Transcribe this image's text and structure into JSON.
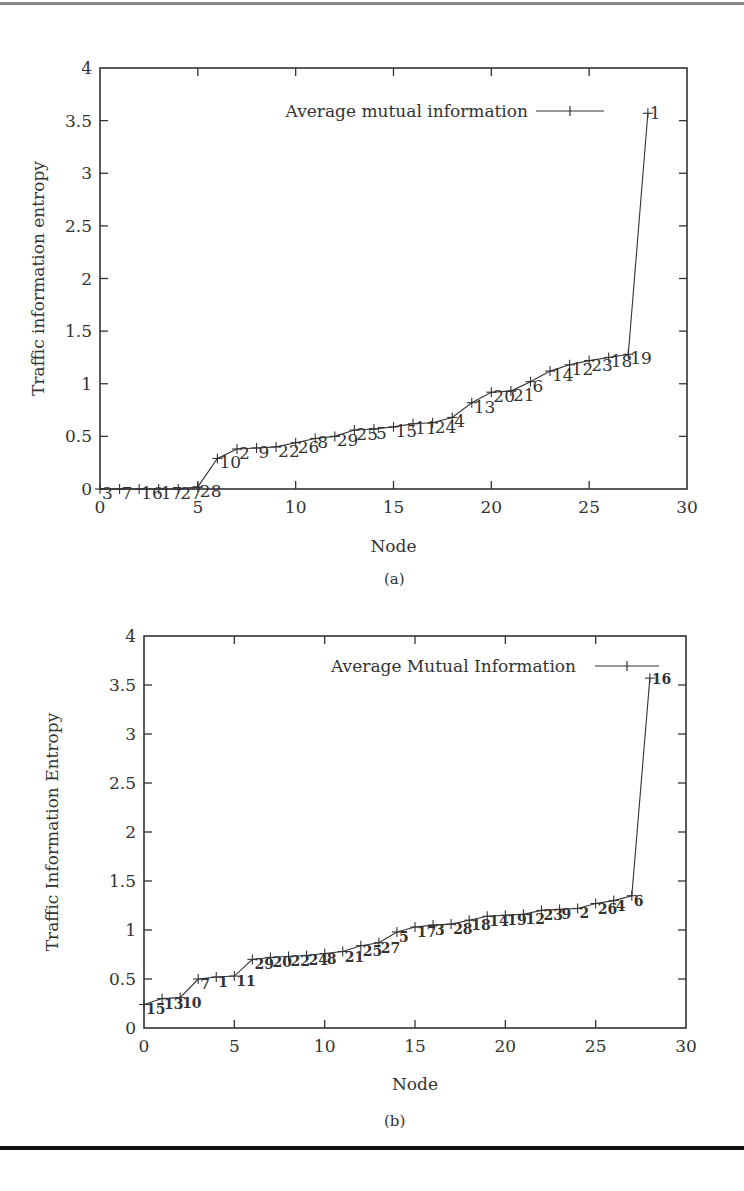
{
  "chart_data": [
    {
      "type": "line",
      "panel": "(a)",
      "title": "",
      "xlabel": "Node",
      "ylabel": "Traffic information entropy",
      "xlim": [
        0,
        30
      ],
      "ylim": [
        0,
        4
      ],
      "xticks": [
        "0",
        "5",
        "10",
        "15",
        "20",
        "25",
        "30"
      ],
      "yticks": [
        "0",
        "0.5",
        "1",
        "1.5",
        "2",
        "2.5",
        "3",
        "3.5",
        "4"
      ],
      "grid": false,
      "legend": {
        "position": "top-right",
        "entries": [
          "Average mutual information"
        ]
      },
      "series": [
        {
          "name": "Average mutual information",
          "marker": "+",
          "x": [
            0,
            1,
            2,
            3,
            4,
            5,
            6,
            7,
            8,
            9,
            10,
            11,
            12,
            13,
            14,
            15,
            16,
            17,
            18,
            19,
            20,
            21,
            22,
            23,
            24,
            25,
            26,
            27,
            28
          ],
          "values": [
            0,
            0,
            0,
            0,
            0,
            0.02,
            0.29,
            0.38,
            0.39,
            0.4,
            0.44,
            0.48,
            0.5,
            0.56,
            0.57,
            0.59,
            0.62,
            0.63,
            0.68,
            0.82,
            0.92,
            0.93,
            1.02,
            1.12,
            1.18,
            1.22,
            1.25,
            1.28,
            3.57
          ],
          "point_labels": [
            "3",
            "7",
            "16",
            "17",
            "27",
            "28",
            "10",
            "2",
            "9",
            "22",
            "26",
            "8",
            "29",
            "25",
            "5",
            "15",
            "11",
            "24",
            "4",
            "13",
            "20",
            "21",
            "6",
            "14",
            "12",
            "23",
            "18",
            "19",
            "1"
          ]
        }
      ]
    },
    {
      "type": "line",
      "panel": "(b)",
      "title": "",
      "xlabel": "Node",
      "ylabel": "Traffic Information Entropy",
      "xlim": [
        0,
        30
      ],
      "ylim": [
        0,
        4
      ],
      "xticks": [
        "0",
        "5",
        "10",
        "15",
        "20",
        "25",
        "30"
      ],
      "yticks": [
        "0",
        "0.5",
        "1",
        "1.5",
        "2",
        "2.5",
        "3",
        "3.5",
        "4"
      ],
      "grid": false,
      "legend": {
        "position": "top-right",
        "entries": [
          "Average Mutual Information"
        ]
      },
      "series": [
        {
          "name": "Average Mutual Information",
          "marker": "+",
          "x": [
            0,
            1,
            2,
            3,
            4,
            5,
            6,
            7,
            8,
            9,
            10,
            11,
            12,
            13,
            14,
            15,
            16,
            17,
            18,
            19,
            20,
            21,
            22,
            23,
            24,
            25,
            26,
            27,
            28
          ],
          "values": [
            0.24,
            0.3,
            0.31,
            0.5,
            0.52,
            0.53,
            0.7,
            0.72,
            0.73,
            0.74,
            0.76,
            0.78,
            0.84,
            0.87,
            0.98,
            1.03,
            1.05,
            1.06,
            1.1,
            1.14,
            1.15,
            1.16,
            1.2,
            1.21,
            1.22,
            1.27,
            1.3,
            1.35,
            3.57
          ],
          "point_labels": [
            "15",
            "13",
            "10",
            "7",
            "1",
            "11",
            "29",
            "20",
            "22",
            "24",
            "8",
            "21",
            "25",
            "27",
            "5",
            "17",
            "3",
            "28",
            "18",
            "14",
            "19",
            "12",
            "23",
            "9",
            "2",
            "26",
            "4",
            "6",
            "16"
          ]
        }
      ]
    }
  ],
  "captions": {
    "a": "(a)",
    "b": "(b)"
  }
}
